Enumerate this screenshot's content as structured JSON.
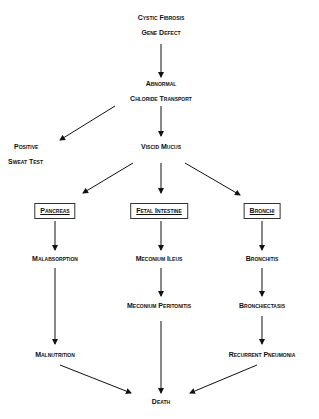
{
  "diagram": {
    "type": "flowchart",
    "nodes": {
      "cf_line1": "Cystic Fibrosis",
      "cf_line2": "Gene Defect",
      "abn_line1": "Abnormal",
      "abn_line2": "Chloride Transport",
      "sweat_line1": "Positive",
      "sweat_line2": "Sweat Test",
      "viscid": "Viscid Mucus",
      "pancreas": "Pancreas",
      "fetal": "Fetal Intestine",
      "bronchi": "Bronchi",
      "malabsorption": "Malabsorption",
      "meconium_ileus": "Meconium Ileus",
      "bronchitis": "Bronchitis",
      "meconium_peritonitis": "Meconium Peritonitis",
      "bronchiectasis": "Bronchiectasis",
      "malnutrition": "Malnutrition",
      "recurrent_pneumonia": "Recurrent Pneumonia",
      "death": "Death"
    },
    "edges": [
      [
        "Cystic Fibrosis Gene Defect",
        "Abnormal Chloride Transport"
      ],
      [
        "Abnormal Chloride Transport",
        "Positive Sweat Test"
      ],
      [
        "Abnormal Chloride Transport",
        "Viscid Mucus"
      ],
      [
        "Viscid Mucus",
        "Pancreas"
      ],
      [
        "Viscid Mucus",
        "Fetal Intestine"
      ],
      [
        "Viscid Mucus",
        "Bronchi"
      ],
      [
        "Pancreas",
        "Malabsorption"
      ],
      [
        "Malabsorption",
        "Malnutrition"
      ],
      [
        "Malnutrition",
        "Death"
      ],
      [
        "Fetal Intestine",
        "Meconium Ileus"
      ],
      [
        "Meconium Ileus",
        "Meconium Peritonitis"
      ],
      [
        "Meconium Peritonitis",
        "Death"
      ],
      [
        "Bronchi",
        "Bronchitis"
      ],
      [
        "Bronchitis",
        "Bronchiectasis"
      ],
      [
        "Bronchiectasis",
        "Recurrent Pneumonia"
      ],
      [
        "Recurrent Pneumonia",
        "Death"
      ]
    ]
  }
}
